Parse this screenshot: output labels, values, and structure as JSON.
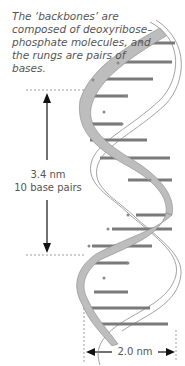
{
  "caption": "The ‘backbones’ are composed of deoxyribose–phosphate molecules, and the rungs are pairs of bases.",
  "pitch": {
    "value_label": "3.4 nm",
    "count_label": "10 base pairs"
  },
  "width": {
    "label": "2.0 nm"
  },
  "colors": {
    "backbone": "#bdbdbd",
    "rung": "#7a7a7a",
    "outline": "#8a8a8a",
    "text": "#555555",
    "arrow": "#111111"
  }
}
